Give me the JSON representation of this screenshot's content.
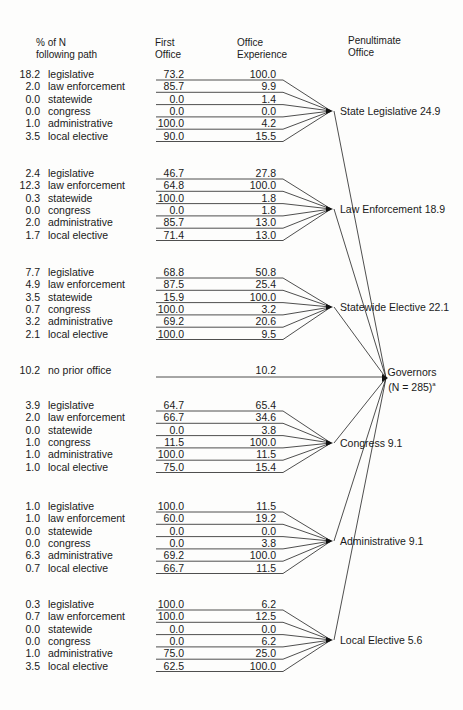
{
  "headers": {
    "pct_line1": "% of N",
    "pct_line2": "following path",
    "first_line1": "First",
    "first_line2": "Office",
    "exp_line1": "Office",
    "exp_line2": "Experience",
    "pen_line1": "Penultimate",
    "pen_line2": "Office"
  },
  "groups": [
    {
      "penultimate": "State Legislative 24.9",
      "rows": [
        {
          "pct": "18.2",
          "label": "legislative",
          "first": "73.2",
          "exp": "100.0"
        },
        {
          "pct": "2.0",
          "label": "law enforcement",
          "first": "85.7",
          "exp": "9.9"
        },
        {
          "pct": "0.0",
          "label": "statewide",
          "first": "0.0",
          "exp": "1.4"
        },
        {
          "pct": "0.0",
          "label": "congress",
          "first": "0.0",
          "exp": "0.0"
        },
        {
          "pct": "1.0",
          "label": "administrative",
          "first": "100.0",
          "exp": "4.2"
        },
        {
          "pct": "3.5",
          "label": "local elective",
          "first": "90.0",
          "exp": "15.5"
        }
      ]
    },
    {
      "penultimate": "Law Enforcement 18.9",
      "rows": [
        {
          "pct": "2.4",
          "label": "legislative",
          "first": "46.7",
          "exp": "27.8"
        },
        {
          "pct": "12.3",
          "label": "law enforcement",
          "first": "64.8",
          "exp": "100.0"
        },
        {
          "pct": "0.3",
          "label": "statewide",
          "first": "100.0",
          "exp": "1.8"
        },
        {
          "pct": "0.0",
          "label": "congress",
          "first": "0.0",
          "exp": "1.8"
        },
        {
          "pct": "2.0",
          "label": "administrative",
          "first": "85.7",
          "exp": "13.0"
        },
        {
          "pct": "1.7",
          "label": "local elective",
          "first": "71.4",
          "exp": "13.0"
        }
      ]
    },
    {
      "penultimate": "Statewide Elective 22.1",
      "rows": [
        {
          "pct": "7.7",
          "label": "legislative",
          "first": "68.8",
          "exp": "50.8"
        },
        {
          "pct": "4.9",
          "label": "law enforcement",
          "first": "87.5",
          "exp": "25.4"
        },
        {
          "pct": "3.5",
          "label": "statewide",
          "first": "15.9",
          "exp": "100.0"
        },
        {
          "pct": "0.7",
          "label": "congress",
          "first": "100.0",
          "exp": "3.2"
        },
        {
          "pct": "3.2",
          "label": "administrative",
          "first": "69.2",
          "exp": "20.6"
        },
        {
          "pct": "2.1",
          "label": "local elective",
          "first": "100.0",
          "exp": "9.5"
        }
      ]
    },
    {
      "penultimate": "Congress 9.1",
      "rows": [
        {
          "pct": "3.9",
          "label": "legislative",
          "first": "64.7",
          "exp": "65.4"
        },
        {
          "pct": "2.0",
          "label": "law enforcement",
          "first": "66.7",
          "exp": "34.6"
        },
        {
          "pct": "0.0",
          "label": "statewide",
          "first": "0.0",
          "exp": "3.8"
        },
        {
          "pct": "1.0",
          "label": "congress",
          "first": "11.5",
          "exp": "100.0"
        },
        {
          "pct": "1.0",
          "label": "administrative",
          "first": "100.0",
          "exp": "11.5"
        },
        {
          "pct": "1.0",
          "label": "local elective",
          "first": "75.0",
          "exp": "15.4"
        }
      ]
    },
    {
      "penultimate": "Administrative 9.1",
      "rows": [
        {
          "pct": "1.0",
          "label": "legislative",
          "first": "100.0",
          "exp": "11.5"
        },
        {
          "pct": "1.0",
          "label": "law enforcement",
          "first": "60.0",
          "exp": "19.2"
        },
        {
          "pct": "0.0",
          "label": "statewide",
          "first": "0.0",
          "exp": "0.0"
        },
        {
          "pct": "0.0",
          "label": "congress",
          "first": "0.0",
          "exp": "3.8"
        },
        {
          "pct": "6.3",
          "label": "administrative",
          "first": "69.2",
          "exp": "100.0"
        },
        {
          "pct": "0.7",
          "label": "local elective",
          "first": "66.7",
          "exp": "11.5"
        }
      ]
    },
    {
      "penultimate": "Local Elective 5.6",
      "rows": [
        {
          "pct": "0.3",
          "label": "legislative",
          "first": "100.0",
          "exp": "6.2"
        },
        {
          "pct": "0.7",
          "label": "law enforcement",
          "first": "100.0",
          "exp": "12.5"
        },
        {
          "pct": "0.0",
          "label": "statewide",
          "first": "0.0",
          "exp": "0.0"
        },
        {
          "pct": "0.0",
          "label": "congress",
          "first": "0.0",
          "exp": "6.2"
        },
        {
          "pct": "1.0",
          "label": "administrative",
          "first": "75.0",
          "exp": "25.0"
        },
        {
          "pct": "3.5",
          "label": "local elective",
          "first": "62.5",
          "exp": "100.0"
        }
      ]
    }
  ],
  "no_prior": {
    "pct": "10.2",
    "label": "no prior office",
    "exp": "10.2"
  },
  "governors": {
    "line1": "Governors",
    "line2": "(N = 285)",
    "sup": "a"
  },
  "colors": {
    "ink": "#1a1a1a",
    "paper": "#fdfdfc"
  }
}
